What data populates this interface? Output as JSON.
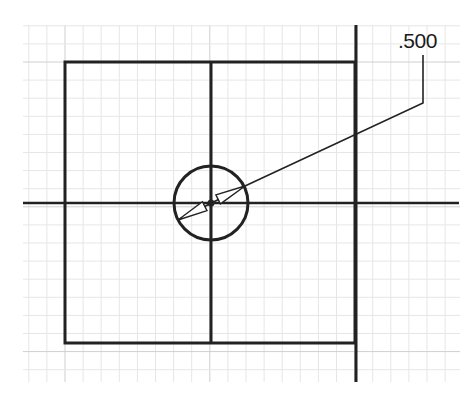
{
  "diagram": {
    "type": "cad-sketch",
    "grid": {
      "x0": 23,
      "y0": 25,
      "x1": 460,
      "y1": 382,
      "spacing": 18.1,
      "minor_color": "#e6e6e6",
      "major_color": "#cfcfcf"
    },
    "rectangle": {
      "x": 65,
      "y": 62,
      "width": 290,
      "height": 281,
      "stroke": "#222222",
      "stroke_width": 3
    },
    "center_vertical_line": {
      "x": 211,
      "y1": 62,
      "y2": 343
    },
    "center_horizontal_line": {
      "y": 203,
      "x1": 23,
      "x2": 459
    },
    "right_vertical_line": {
      "x": 356,
      "y1": 25,
      "y2": 382
    },
    "circle": {
      "cx": 211,
      "cy": 203,
      "r": 37
    },
    "dimension": {
      "label": ".500",
      "kind": "diameter",
      "leader_points": [
        [
          178,
          220
        ],
        [
          245,
          186
        ],
        [
          423,
          103
        ],
        [
          423,
          55
        ]
      ]
    }
  }
}
